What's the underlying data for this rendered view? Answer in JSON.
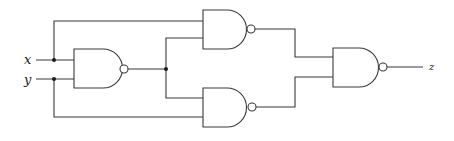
{
  "diagram": {
    "type": "logic-circuit",
    "inputs": [
      {
        "id": "x",
        "label": "x"
      },
      {
        "id": "y",
        "label": "y"
      }
    ],
    "outputs": [
      {
        "id": "z",
        "label": "z"
      }
    ],
    "gates": [
      {
        "id": "g1",
        "type": "NAND",
        "inputs": [
          "x",
          "y"
        ]
      },
      {
        "id": "g2",
        "type": "NAND",
        "inputs": [
          "x",
          "g1"
        ]
      },
      {
        "id": "g3",
        "type": "NAND",
        "inputs": [
          "g1",
          "y"
        ]
      },
      {
        "id": "g4",
        "type": "NAND",
        "inputs": [
          "g2",
          "g3"
        ],
        "output": "z"
      }
    ],
    "colors": {
      "line": "#3a3a3a",
      "background": "#ffffff"
    }
  }
}
